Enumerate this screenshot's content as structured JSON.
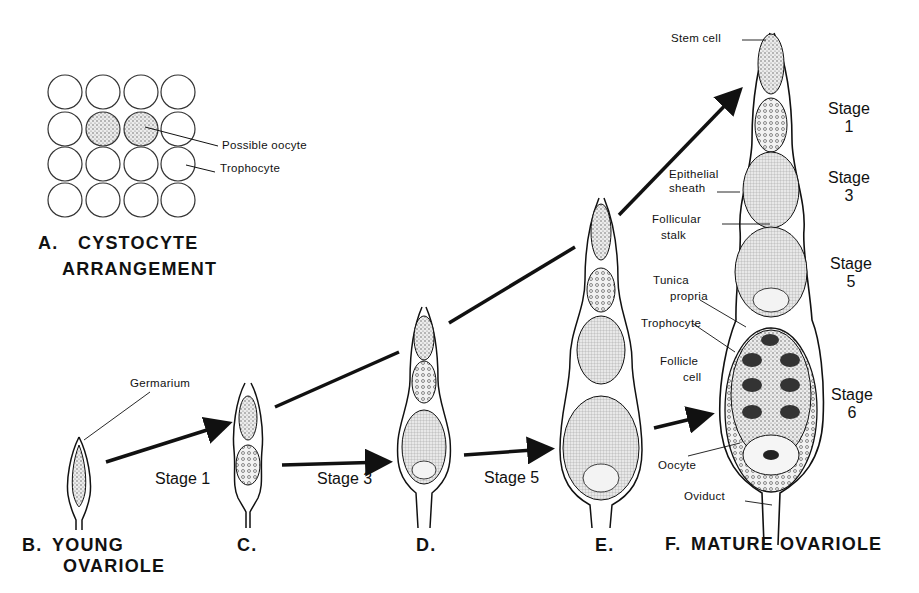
{
  "figure": {
    "panels": [
      {
        "id": "A",
        "letter": "A.",
        "title_line1": "CYSTOCYTE",
        "title_line2": "ARRANGEMENT"
      },
      {
        "id": "B",
        "letter": "B.",
        "title_line1": "YOUNG",
        "title_line2": "OVARIOLE"
      },
      {
        "id": "C",
        "letter": "C."
      },
      {
        "id": "D",
        "letter": "D."
      },
      {
        "id": "E",
        "letter": "E."
      },
      {
        "id": "F",
        "letter": "F.",
        "title_line1": "MATURE OVARIOLE"
      }
    ],
    "panel_a_labels": {
      "possible_oocyte": "Possible oocyte",
      "trophocyte": "Trophocyte"
    },
    "panel_b_labels": {
      "germarium": "Germarium"
    },
    "transition_labels": {
      "stage1": "Stage 1",
      "stage3": "Stage 3",
      "stage5": "Stage 5"
    },
    "panel_f_labels": {
      "stem_cell": "Stem cell",
      "epithelial_sheath_1": "Epithelial",
      "epithelial_sheath_2": "sheath",
      "follicular_stalk_1": "Follicular",
      "follicular_stalk_2": "stalk",
      "tunica_propria_1": "Tunica",
      "tunica_propria_2": "propria",
      "trophocyte": "Trophocyte",
      "follicle_cell_1": "Follicle",
      "follicle_cell_2": "cell",
      "oocyte": "Oocyte",
      "oviduct": "Oviduct"
    },
    "panel_f_stages": [
      {
        "word": "Stage",
        "num": "1"
      },
      {
        "word": "Stage",
        "num": "3"
      },
      {
        "word": "Stage",
        "num": "5"
      },
      {
        "word": "Stage",
        "num": "6"
      }
    ]
  },
  "colors": {
    "ink": "#111111",
    "background": "#ffffff",
    "cell_fill": "#e6e6e6",
    "stipple_fill": "#bdbdbd"
  }
}
